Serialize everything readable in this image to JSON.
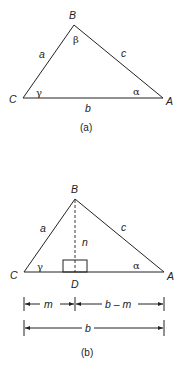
{
  "figure_a": {
    "caption": "(a)",
    "vertices": {
      "A": "A",
      "B": "B",
      "C": "C"
    },
    "sides": {
      "a": "a",
      "b": "b",
      "c": "c"
    },
    "angles": {
      "alpha": "α",
      "beta": "β",
      "gamma": "γ"
    }
  },
  "figure_b": {
    "caption": "(b)",
    "vertices": {
      "A": "A",
      "B": "B",
      "C": "C",
      "D": "D"
    },
    "sides": {
      "a": "a",
      "c": "c",
      "n": "n"
    },
    "angles": {
      "alpha": "α",
      "gamma": "γ"
    },
    "dimensions": {
      "m": "m",
      "b_minus_m": "b – m",
      "b": "b"
    }
  }
}
